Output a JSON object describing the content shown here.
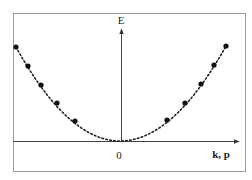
{
  "diagram": {
    "frame": {
      "x": 13,
      "y": 13,
      "width": 232,
      "height": 158,
      "stroke": "#9a9a9a"
    },
    "axes": {
      "origin": {
        "x": 121,
        "y": 141
      },
      "x_axis": {
        "from": 13,
        "to": 239,
        "label": "k, p",
        "label_pos": {
          "x": 221,
          "y": 158
        }
      },
      "y_axis": {
        "from": 141,
        "to": 29,
        "label": "E",
        "label_pos": {
          "x": 121,
          "y": 24
        }
      },
      "origin_label": "0",
      "origin_label_pos": {
        "x": 119,
        "y": 159
      },
      "color": "#444444"
    },
    "curve": {
      "type": "parabola",
      "style": "dotted",
      "vertex": {
        "x": 120,
        "y": 141
      },
      "left_end": {
        "x": 16,
        "y": 47
      },
      "right_end": {
        "x": 226,
        "y": 46
      },
      "color": "#222222"
    },
    "points": [
      {
        "x": 16,
        "y": 47
      },
      {
        "x": 28,
        "y": 66
      },
      {
        "x": 41,
        "y": 85
      },
      {
        "x": 57,
        "y": 103
      },
      {
        "x": 75,
        "y": 121
      },
      {
        "x": 167,
        "y": 120
      },
      {
        "x": 185,
        "y": 103
      },
      {
        "x": 201,
        "y": 84
      },
      {
        "x": 214,
        "y": 65
      },
      {
        "x": 226,
        "y": 46
      }
    ],
    "point_color": "#111111"
  }
}
